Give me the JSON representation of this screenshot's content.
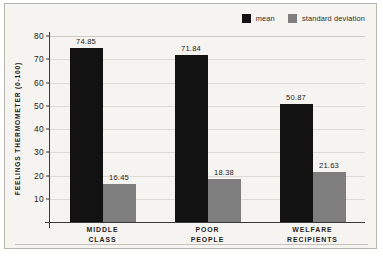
{
  "chart_data": {
    "type": "bar",
    "title": "",
    "subtitle": "",
    "xlabel": "",
    "ylabel": "FEELINGS THERMOMETER (0-100)",
    "categories": [
      "MIDDLE CLASS",
      "POOR PEOPLE",
      "WELFARE RECIPIENTS"
    ],
    "category_lines": [
      [
        "MIDDLE",
        "CLASS"
      ],
      [
        "POOR",
        "PEOPLE"
      ],
      [
        "WELFARE",
        "RECIPIENTS"
      ]
    ],
    "series": [
      {
        "name": "mean",
        "color": "#121212",
        "values": [
          74.85,
          71.84,
          50.87
        ],
        "labels": [
          "74.85",
          "71.84",
          "50.87"
        ]
      },
      {
        "name": "standard deviation",
        "color": "#7e7e7e",
        "values": [
          16.45,
          18.38,
          21.63
        ],
        "labels": [
          "16.45",
          "18.38",
          "21.63"
        ]
      }
    ],
    "ylim": [
      0,
      80
    ],
    "yticks": [
      10,
      20,
      30,
      40,
      50,
      60,
      70,
      80
    ],
    "ytick_labels": [
      "10",
      "20",
      "30",
      "40",
      "50",
      "60",
      "70",
      "80"
    ],
    "grid": true,
    "grid_axis": "y",
    "legend_position": "top-right",
    "legend_entries": [
      "mean",
      "standard deviation"
    ],
    "background_color": "#f6f4f0",
    "frame_color": "#b9b5ad",
    "gridline_color": "#dedbd4",
    "axis_color": "#3a3a3a"
  }
}
